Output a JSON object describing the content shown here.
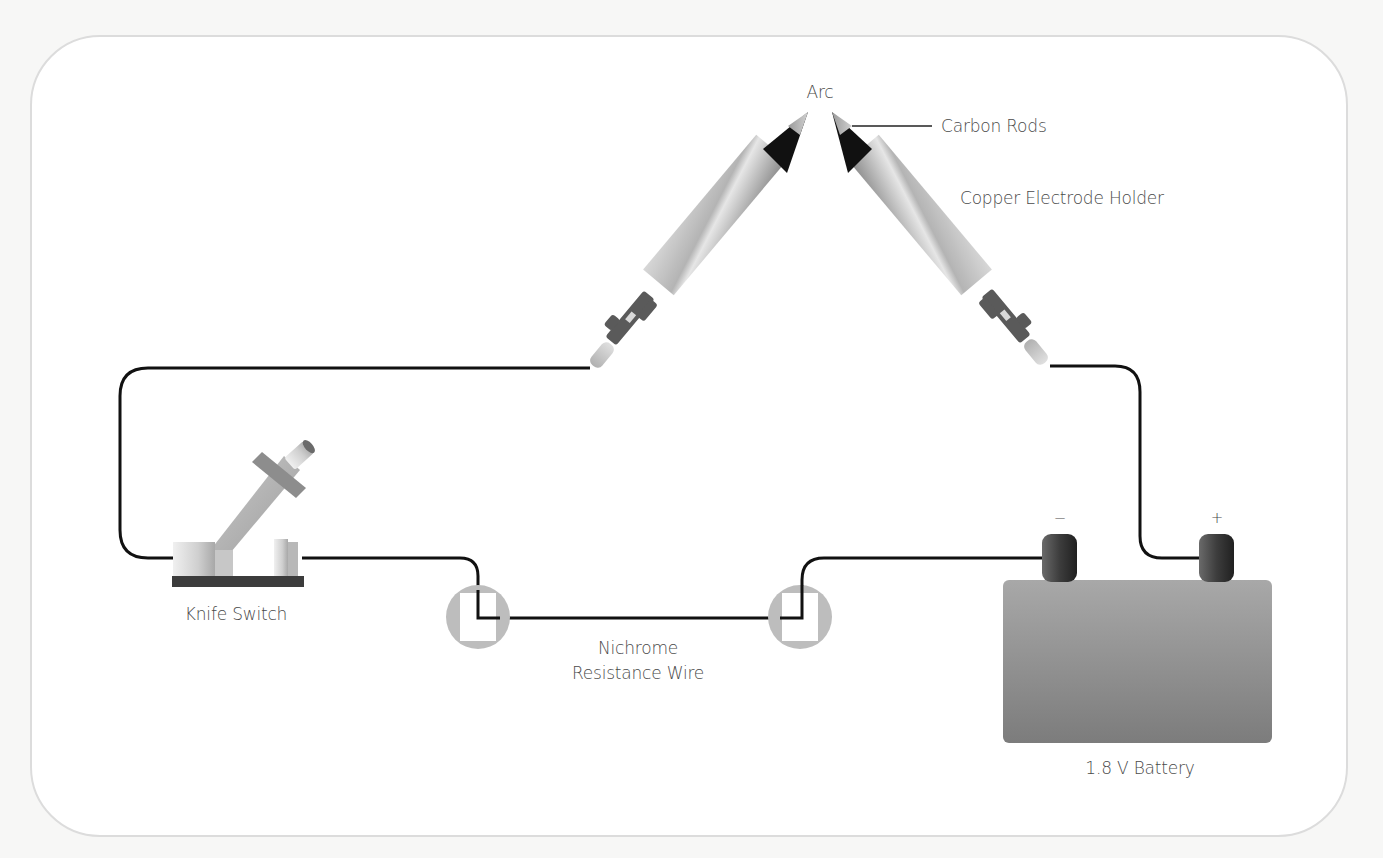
{
  "diagram": {
    "labels": {
      "arc": "Arc",
      "carbon_rods": "Carbon Rods",
      "copper_holder": "Copper Electrode Holder",
      "knife_switch": "Knife Switch",
      "nichrome_line1": "Nichrome",
      "nichrome_line2": "Resistance Wire",
      "battery": "1.8 V Battery",
      "terminal_negative": "−",
      "terminal_positive": "+"
    },
    "components": [
      {
        "id": "left-electrode",
        "type": "copper electrode holder with carbon rod"
      },
      {
        "id": "right-electrode",
        "type": "copper electrode holder with carbon rod"
      },
      {
        "id": "knife-switch",
        "type": "knife switch (open)"
      },
      {
        "id": "nichrome-wire",
        "type": "resistance wire between two clamps"
      },
      {
        "id": "battery",
        "type": "battery",
        "voltage": "1.8 V"
      }
    ],
    "connections": [
      [
        "left-electrode",
        "knife-switch"
      ],
      [
        "knife-switch",
        "nichrome-wire"
      ],
      [
        "nichrome-wire",
        "battery-negative"
      ],
      [
        "battery-positive",
        "right-electrode"
      ]
    ],
    "colors": {
      "wire": "#111111",
      "background": "#ffffff",
      "card_border": "#dcdcdc",
      "label": "#4a4a4a",
      "battery": "#8c8c8c",
      "terminal": "#3a3a3a"
    }
  }
}
